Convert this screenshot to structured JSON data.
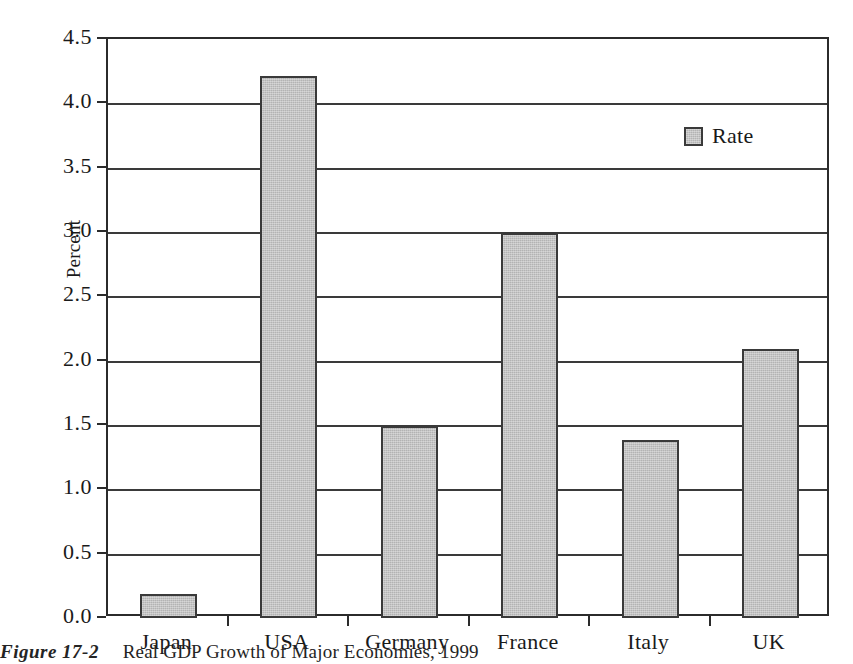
{
  "figure": {
    "caption_label": "Figure 17-2",
    "caption_text": "Real GDP Growth of Major Economies, 1999"
  },
  "legend": {
    "position": "top-right-inside",
    "entries": [
      {
        "label": "Rate",
        "color": "#b3b3b3"
      }
    ]
  },
  "chart_data": {
    "type": "bar",
    "title": "Real GDP Growth of Major Economies, 1999",
    "xlabel": "",
    "ylabel": "Percent",
    "categories": [
      "Japan",
      "USA",
      "Germany",
      "France",
      "Italy",
      "UK"
    ],
    "series": [
      {
        "name": "Rate",
        "values": [
          0.19,
          4.21,
          1.49,
          2.99,
          1.38,
          2.09
        ]
      }
    ],
    "ylim": [
      0.0,
      4.5
    ],
    "ytick_step": 0.5,
    "ytick_labels": [
      "0.0",
      "0.5",
      "1.0",
      "1.5",
      "2.0",
      "2.5",
      "3.0",
      "3.5",
      "4.0",
      "4.5"
    ],
    "ytick_values": [
      0.0,
      0.5,
      1.0,
      1.5,
      2.0,
      2.5,
      3.0,
      3.5,
      4.0,
      4.5
    ],
    "grid": true,
    "grid_axis": "y",
    "bar_color": "#b3b3b3",
    "bar_edge_color": "#3a3a3a",
    "frame_color": "#2b2b2b",
    "legend_position": "upper right"
  }
}
